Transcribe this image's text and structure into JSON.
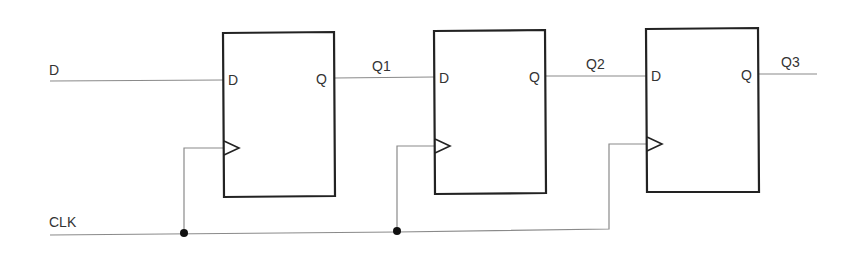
{
  "diagram": {
    "type": "shift-register",
    "stroke_color": "#8a8a8a",
    "box_color": "#222222",
    "inputs": {
      "data_label": "D",
      "clock_label": "CLK"
    },
    "flip_flops": [
      {
        "id": "ff1",
        "d_pin": "D",
        "q_pin": "Q",
        "output_label": "Q1"
      },
      {
        "id": "ff2",
        "d_pin": "D",
        "q_pin": "Q",
        "output_label": "Q2"
      },
      {
        "id": "ff3",
        "d_pin": "D",
        "q_pin": "Q",
        "output_label": "Q3"
      }
    ]
  }
}
